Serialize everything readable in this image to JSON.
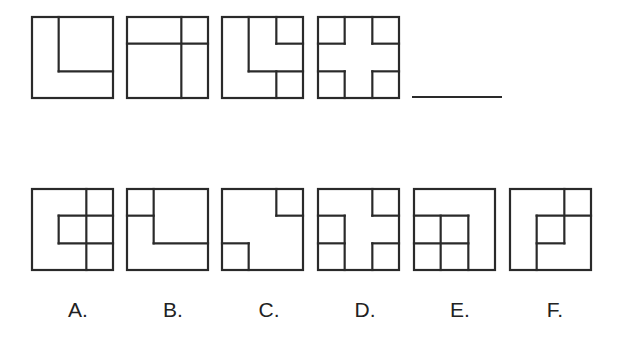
{
  "puzzle": {
    "sequence": [
      {
        "id": "seq-1",
        "lines": [
          [
            1,
            0,
            1,
            2
          ],
          [
            1,
            2,
            3,
            2
          ]
        ]
      },
      {
        "id": "seq-2",
        "lines": [
          [
            0,
            1,
            3,
            1
          ],
          [
            2,
            0,
            2,
            3
          ]
        ]
      },
      {
        "id": "seq-3",
        "lines": [
          [
            1,
            0,
            1,
            2
          ],
          [
            1,
            2,
            3,
            2
          ],
          [
            2,
            0,
            2,
            1
          ],
          [
            2,
            1,
            3,
            1
          ],
          [
            2,
            2,
            2,
            3
          ]
        ]
      },
      {
        "id": "seq-4",
        "lines": [
          [
            1,
            0,
            1,
            1
          ],
          [
            0,
            1,
            1,
            1
          ],
          [
            2,
            0,
            2,
            1
          ],
          [
            2,
            1,
            3,
            1
          ],
          [
            0,
            2,
            1,
            2
          ],
          [
            1,
            2,
            1,
            3
          ],
          [
            2,
            2,
            3,
            2
          ],
          [
            2,
            2,
            2,
            3
          ]
        ]
      }
    ],
    "blank": "____",
    "options": [
      {
        "label": "A.",
        "lines": [
          [
            2,
            0,
            2,
            3
          ],
          [
            1,
            1,
            3,
            1
          ],
          [
            1,
            2,
            3,
            2
          ],
          [
            1,
            1,
            1,
            2
          ]
        ]
      },
      {
        "label": "B.",
        "lines": [
          [
            1,
            0,
            1,
            2
          ],
          [
            1,
            2,
            3,
            2
          ],
          [
            0,
            1,
            1,
            1
          ]
        ]
      },
      {
        "label": "C.",
        "lines": [
          [
            2,
            0,
            2,
            1
          ],
          [
            2,
            1,
            3,
            1
          ],
          [
            0,
            2,
            1,
            2
          ],
          [
            1,
            2,
            1,
            3
          ]
        ]
      },
      {
        "label": "D.",
        "lines": [
          [
            0,
            1,
            1,
            1
          ],
          [
            1,
            1,
            1,
            3
          ],
          [
            0,
            2,
            1,
            2
          ],
          [
            2,
            0,
            2,
            1
          ],
          [
            2,
            1,
            3,
            1
          ],
          [
            2,
            2,
            3,
            2
          ],
          [
            2,
            2,
            2,
            3
          ]
        ]
      },
      {
        "label": "E.",
        "lines": [
          [
            0,
            1,
            2,
            1
          ],
          [
            2,
            1,
            2,
            3
          ],
          [
            0,
            2,
            2,
            2
          ],
          [
            1,
            1,
            1,
            3
          ]
        ]
      },
      {
        "label": "F.",
        "lines": [
          [
            2,
            0,
            2,
            2
          ],
          [
            1,
            1,
            3,
            1
          ],
          [
            1,
            1,
            1,
            3
          ],
          [
            1,
            2,
            2,
            2
          ]
        ]
      }
    ],
    "style": {
      "stroke_color": "#2a2a2a",
      "stroke_width": 2.2
    }
  }
}
